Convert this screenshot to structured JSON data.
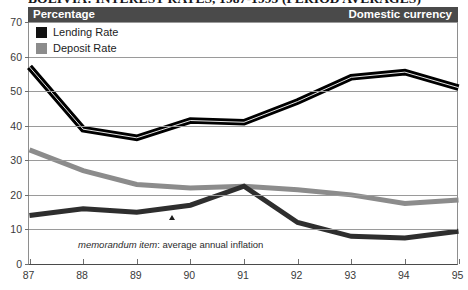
{
  "title": "BOLIVIA: INTEREST RATES, 1987-1995 (PERIOD AVERAGES)",
  "header": {
    "left_label": "Percentage",
    "right_label": "Domestic currency",
    "background_color": "#4a4a4a"
  },
  "legend": {
    "position": "top-left",
    "items": [
      {
        "label": "Lending Rate",
        "color": "#111111",
        "swatch": "filled-square"
      },
      {
        "label": "Deposit Rate",
        "color": "#8c8c8c",
        "swatch": "filled-square"
      }
    ]
  },
  "annotation": {
    "italic_part": "memorandum item",
    "rest_part": ": average annual inflation",
    "marker": "triangle-marker"
  },
  "chart_data": {
    "type": "line",
    "title": "BOLIVIA: INTEREST RATES, 1987-1995 (PERIOD AVERAGES)",
    "subtitle": "Percentage — Domestic currency",
    "xlabel": "",
    "ylabel": "Percentage",
    "x": [
      "87",
      "88",
      "89",
      "90",
      "91",
      "92",
      "93",
      "94",
      "95"
    ],
    "categories": [
      "87",
      "88",
      "89",
      "90",
      "91",
      "92",
      "93",
      "94",
      "95"
    ],
    "xlim": [
      1987,
      1995
    ],
    "ylim": [
      0,
      70
    ],
    "yticks": [
      0,
      10,
      20,
      30,
      40,
      50,
      60,
      70
    ],
    "grid": true,
    "legend_position": "upper-left",
    "series": [
      {
        "name": "Lending Rate",
        "color": "#111111",
        "values": [
          57.0,
          39.0,
          36.5,
          41.5,
          41.0,
          47.0,
          54.0,
          55.5,
          51.0
        ]
      },
      {
        "name": "Deposit Rate",
        "color": "#8c8c8c",
        "values": [
          33.0,
          27.0,
          23.0,
          22.0,
          22.5,
          21.5,
          20.0,
          17.5,
          18.5
        ]
      },
      {
        "name": "memorandum item: average annual inflation",
        "color": "#2e2e2e",
        "values": [
          14.0,
          16.0,
          15.0,
          17.0,
          22.5,
          12.0,
          8.0,
          7.5,
          9.5
        ]
      }
    ]
  }
}
